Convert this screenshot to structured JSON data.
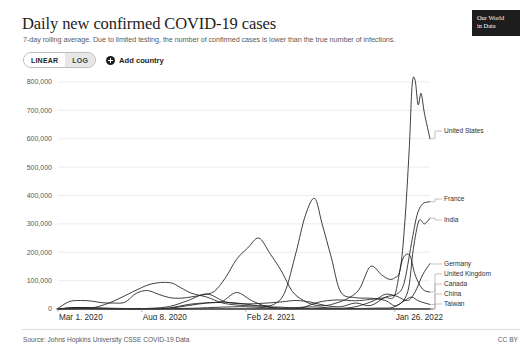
{
  "header": {
    "title": "Daily new confirmed COVID-19 cases",
    "subtitle": "7-day rolling average. Due to limited testing, the number of confirmed cases is lower than the true number of infections.",
    "logo_line1": "Our World",
    "logo_line2": "in Data"
  },
  "controls": {
    "linear_label": "LINEAR",
    "log_label": "LOG",
    "active_scale": "LINEAR",
    "add_country_label": "Add country",
    "plus_icon": "plus-circle-icon"
  },
  "footer": {
    "source": "Source: Johns Hopkins University CSSE COVID-19 Data",
    "license": "CC BY"
  },
  "colors": {
    "line": "#1d1d1d",
    "grid": "#e4e4e4",
    "axis": "#5b5b5b",
    "text": "#1d1d1d",
    "muted": "#58585a"
  },
  "chart_data": {
    "type": "line",
    "title": "Daily new confirmed COVID-19 cases",
    "subtitle": "7-day rolling average. Due to limited testing, the number of confirmed cases is lower than the true number of infections.",
    "xlabel": "",
    "ylabel": "",
    "scale": "linear",
    "grid": true,
    "legend_position": "right-inline",
    "ylim": [
      0,
      800000
    ],
    "yticks": [
      0,
      100000,
      200000,
      300000,
      400000,
      500000,
      600000,
      700000,
      800000
    ],
    "ytick_labels": [
      "0",
      "100,000",
      "200,000",
      "300,000",
      "400,000",
      "500,000",
      "600,000",
      "700,000",
      "800,000"
    ],
    "xlim": [
      "2020-03-01",
      "2022-02-20"
    ],
    "xticks": [
      "2020-03-01",
      "2020-08-08",
      "2021-02-24",
      "2022-01-26"
    ],
    "xtick_labels": [
      "Mar 1, 2020",
      "Aug 8, 2020",
      "Feb 24, 2021",
      "Jan 26, 2022"
    ],
    "series": [
      {
        "name": "United States",
        "label_y_value": 600000,
        "x": [
          0,
          0.03,
          0.06,
          0.09,
          0.12,
          0.15,
          0.18,
          0.21,
          0.24,
          0.27,
          0.3,
          0.33,
          0.36,
          0.39,
          0.42,
          0.45,
          0.48,
          0.51,
          0.54,
          0.57,
          0.6,
          0.63,
          0.66,
          0.69,
          0.72,
          0.75,
          0.78,
          0.81,
          0.84,
          0.87,
          0.89,
          0.905,
          0.92,
          0.932,
          0.944,
          0.952,
          0.96,
          0.968,
          0.976,
          0.985,
          1.0
        ],
        "values": [
          2000,
          26000,
          30000,
          28000,
          22000,
          21000,
          24000,
          55000,
          65000,
          52000,
          40000,
          38000,
          43000,
          50000,
          62000,
          110000,
          175000,
          215000,
          250000,
          195000,
          135000,
          62000,
          30000,
          14000,
          12000,
          22000,
          38000,
          70000,
          150000,
          120000,
          105000,
          110000,
          140000,
          300000,
          560000,
          790000,
          806000,
          720000,
          760000,
          690000,
          600000
        ]
      },
      {
        "name": "India",
        "label_y_value": 330000,
        "x": [
          0,
          0.05,
          0.1,
          0.15,
          0.2,
          0.25,
          0.3,
          0.33,
          0.36,
          0.4,
          0.44,
          0.48,
          0.52,
          0.55,
          0.58,
          0.61,
          0.64,
          0.665,
          0.69,
          0.71,
          0.735,
          0.76,
          0.8,
          0.84,
          0.88,
          0.91,
          0.94,
          0.955,
          0.97,
          0.985,
          1.0
        ],
        "values": [
          200,
          1500,
          6000,
          28000,
          60000,
          88000,
          93000,
          75000,
          55000,
          42000,
          22000,
          14000,
          11000,
          12000,
          16000,
          60000,
          200000,
          330000,
          390000,
          300000,
          180000,
          60000,
          40000,
          38000,
          30000,
          12000,
          60000,
          210000,
          310000,
          300000,
          320000
        ]
      },
      {
        "name": "France",
        "label_y_value": 380000,
        "x": [
          0,
          0.05,
          0.1,
          0.15,
          0.2,
          0.25,
          0.3,
          0.35,
          0.4,
          0.45,
          0.5,
          0.55,
          0.6,
          0.64,
          0.68,
          0.72,
          0.76,
          0.8,
          0.84,
          0.88,
          0.91,
          0.93,
          0.95,
          0.965,
          0.98,
          1.0
        ],
        "values": [
          300,
          4500,
          3000,
          1200,
          900,
          2500,
          9000,
          30000,
          53000,
          25000,
          18000,
          20000,
          25000,
          30000,
          24000,
          12000,
          8000,
          21000,
          12000,
          42000,
          52000,
          90000,
          230000,
          330000,
          370000,
          378000
        ]
      },
      {
        "name": "Germany",
        "label_y_value": 165000,
        "x": [
          0,
          0.05,
          0.1,
          0.15,
          0.2,
          0.25,
          0.3,
          0.35,
          0.4,
          0.45,
          0.5,
          0.55,
          0.6,
          0.65,
          0.7,
          0.75,
          0.8,
          0.85,
          0.88,
          0.91,
          0.94,
          0.96,
          0.98,
          1.0
        ],
        "values": [
          200,
          5500,
          1600,
          500,
          400,
          1100,
          2400,
          12000,
          21000,
          24000,
          18000,
          9000,
          6500,
          2500,
          900,
          1200,
          8000,
          30000,
          52000,
          45000,
          30000,
          60000,
          120000,
          160000
        ]
      },
      {
        "name": "United Kingdom",
        "label_y_value": 110000,
        "x": [
          0,
          0.05,
          0.1,
          0.15,
          0.2,
          0.25,
          0.3,
          0.35,
          0.4,
          0.44,
          0.48,
          0.52,
          0.56,
          0.6,
          0.65,
          0.7,
          0.75,
          0.8,
          0.84,
          0.88,
          0.905,
          0.925,
          0.945,
          0.96,
          0.98,
          1.0
        ],
        "values": [
          100,
          4800,
          4200,
          2600,
          1100,
          1500,
          3800,
          16000,
          22000,
          26000,
          58000,
          30000,
          9000,
          2200,
          2500,
          24000,
          32000,
          29000,
          34000,
          40000,
          48000,
          170000,
          190000,
          120000,
          70000,
          60000
        ]
      },
      {
        "name": "Canada",
        "label_y_value": 75000,
        "x": [
          0,
          0.06,
          0.12,
          0.2,
          0.28,
          0.36,
          0.44,
          0.5,
          0.56,
          0.62,
          0.68,
          0.74,
          0.8,
          0.86,
          0.9,
          0.93,
          0.95,
          0.97,
          1.0
        ],
        "values": [
          50,
          1600,
          1100,
          400,
          600,
          2500,
          6500,
          8000,
          4300,
          3000,
          7800,
          3000,
          1800,
          3200,
          5500,
          28000,
          42000,
          28000,
          16000
        ]
      },
      {
        "name": "China",
        "label_y_value": 40000,
        "x": [
          0,
          0.04,
          0.1,
          0.2,
          0.3,
          0.4,
          0.5,
          0.6,
          0.7,
          0.8,
          0.9,
          0.95,
          1.0
        ],
        "values": [
          1800,
          150,
          60,
          40,
          30,
          50,
          90,
          60,
          80,
          60,
          120,
          200,
          180
        ]
      },
      {
        "name": "Taiwan",
        "label_y_value": 10000,
        "x": [
          0,
          0.1,
          0.2,
          0.3,
          0.4,
          0.5,
          0.58,
          0.62,
          0.7,
          0.8,
          0.9,
          1.0
        ],
        "values": [
          10,
          3,
          2,
          2,
          3,
          5,
          400,
          180,
          10,
          5,
          8,
          30
        ]
      }
    ],
    "legend_entries": [
      {
        "name": "United States",
        "y": 63
      },
      {
        "name": "France",
        "y": 131
      },
      {
        "name": "India",
        "y": 152
      },
      {
        "name": "Germany",
        "y": 196
      },
      {
        "name": "United Kingdom",
        "y": 206
      },
      {
        "name": "Canada",
        "y": 216
      },
      {
        "name": "China",
        "y": 226
      },
      {
        "name": "Taiwan",
        "y": 236
      }
    ]
  }
}
